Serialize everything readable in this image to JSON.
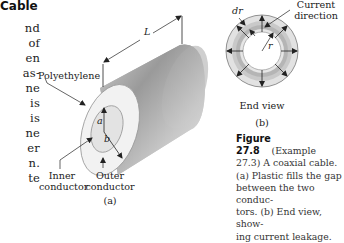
{
  "section_heading": "Cable",
  "body_text_fragments": [
    "nd",
    "of",
    "en",
    "as-",
    "ne",
    "is",
    "is",
    "ne",
    "er",
    "n.",
    "te"
  ],
  "figure_a": {
    "labels": {
      "polyethylene": "Polyethylene",
      "length": "L",
      "inner_radius": "a",
      "outer_radius": "b",
      "inner_conductor_line1": "Inner",
      "inner_conductor_line2": "conductor",
      "outer_conductor_line1": "Outer",
      "outer_conductor_line2": "conductor"
    },
    "panel_label": "(a)"
  },
  "figure_b": {
    "labels": {
      "dr": "dr",
      "r": "r",
      "current_direction_line1": "Current",
      "current_direction_line2": "direction",
      "end_view": "End view"
    },
    "panel_label": "(b)"
  },
  "caption": {
    "figure_number": "Figure 27.8",
    "text": "(Example 27.3) A coaxial cable. (a) Plastic fills the gap between the two conductors. (b) End view, showing current leakage.",
    "lines": [
      "(Example",
      "27.3) A coaxial cable.",
      "(a) Plastic fills the gap",
      "between the two conduc-",
      "tors. (b) End view, show-",
      "ing current leakage."
    ]
  }
}
